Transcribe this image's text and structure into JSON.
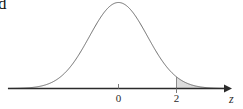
{
  "figure": {
    "corner_artifact_text": "d",
    "background_color": "#ffffff",
    "curve_color": "#6b6b6b",
    "axis_color": "#2b2b2b",
    "shade_color": "#dcdcdc"
  },
  "labels": {
    "tick_zero": "0",
    "tick_two": "2",
    "axis_z": "z"
  },
  "chart_data": {
    "type": "line",
    "title": "",
    "xlabel": "z",
    "ylabel": "",
    "grid": false,
    "legend": null,
    "xlim": [
      -3.8,
      3.8
    ],
    "ylim": [
      0,
      0.42
    ],
    "distribution": "standard normal",
    "mean": 0,
    "sd": 1,
    "tick_values": [
      0,
      2
    ],
    "tick_labels": [
      "0",
      "2"
    ],
    "shaded_region": {
      "from": 2,
      "to": "infinity",
      "label": "",
      "fill": "#dcdcdc",
      "boundary_line_at": 2
    },
    "x": [
      -3.8,
      -3.6,
      -3.4,
      -3.2,
      -3.0,
      -2.8,
      -2.6,
      -2.4,
      -2.2,
      -2.0,
      -1.8,
      -1.6,
      -1.4,
      -1.2,
      -1.0,
      -0.8,
      -0.6,
      -0.4,
      -0.2,
      0.0,
      0.2,
      0.4,
      0.6,
      0.8,
      1.0,
      1.2,
      1.4,
      1.6,
      1.8,
      2.0,
      2.2,
      2.4,
      2.6,
      2.8,
      3.0,
      3.2,
      3.4,
      3.6,
      3.8
    ],
    "y": [
      0.0003,
      0.0006,
      0.0012,
      0.0024,
      0.0044,
      0.0079,
      0.0136,
      0.0224,
      0.0355,
      0.054,
      0.079,
      0.1109,
      0.1497,
      0.1942,
      0.242,
      0.2897,
      0.3332,
      0.3683,
      0.391,
      0.3989,
      0.391,
      0.3683,
      0.3332,
      0.2897,
      0.242,
      0.1942,
      0.1497,
      0.1109,
      0.079,
      0.054,
      0.0355,
      0.0224,
      0.0136,
      0.0079,
      0.0044,
      0.0024,
      0.0012,
      0.0006,
      0.0003
    ]
  }
}
